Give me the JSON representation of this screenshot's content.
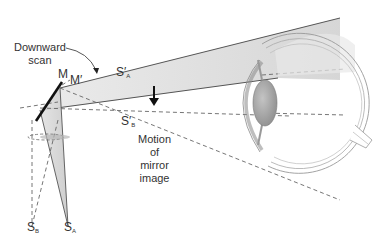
{
  "diagram": {
    "labels": {
      "scan_line1": "Downward",
      "scan_line2": "scan",
      "mirror": "M",
      "mirror_prime": "M′",
      "sa_prime_base": "S′",
      "sa_prime_sub": "A",
      "sb_prime_base": "S′",
      "sb_prime_sub": "B",
      "motion_line1": "Motion",
      "motion_line2": "of",
      "motion_line3": "mirror",
      "motion_line4": "image",
      "sb_base": "S",
      "sb_sub": "B",
      "sa_base": "S",
      "sa_sub": "A"
    },
    "colors": {
      "line": "#555555",
      "dash": "#666666",
      "beam_fill": "#d8d8d8",
      "lens": "#9a9a9a",
      "text": "#333333"
    }
  }
}
